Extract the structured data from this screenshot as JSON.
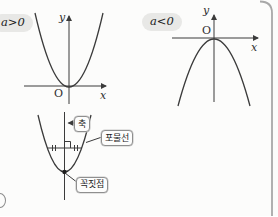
{
  "figures": {
    "positive": {
      "condition": "a>0",
      "y_label": "y",
      "x_label": "x",
      "origin_label": "O",
      "description": "upward-opening parabola with vertex at origin"
    },
    "negative": {
      "condition": "a<0",
      "y_label": "y",
      "x_label": "x",
      "origin_label": "O",
      "description": "downward-opening parabola with vertex at origin"
    },
    "anatomy": {
      "axis_label": "축",
      "parabola_label": "포물선",
      "vertex_label": "꼭짓점",
      "description": "parabola anatomy: axis of symmetry, equal chord halves, vertex point"
    }
  },
  "colors": {
    "stroke": "#3b3b3b",
    "panel_border": "#a8a8a8",
    "condition_pill_bg": "#e8e8e6",
    "background": "#fcfcfb",
    "callout_border": "#8f8f8f"
  }
}
